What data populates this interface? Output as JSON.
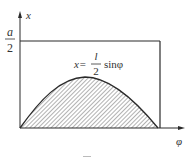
{
  "diagram": {
    "y_axis_label": "x",
    "x_axis_label": "φ",
    "level_numerator": "a",
    "level_denominator": "2",
    "curve_label_prefix": "x=",
    "curve_label_numerator": "l",
    "curve_label_denominator": "2",
    "curve_label_suffix": "sinφ"
  },
  "colors": {
    "line": "#2a2a2a",
    "hatch": "#555555",
    "text": "#333333"
  }
}
